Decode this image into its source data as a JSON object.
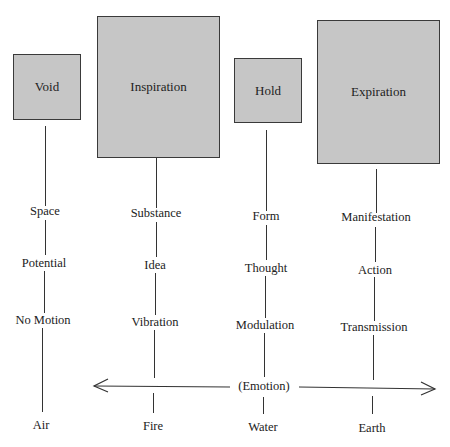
{
  "diagram": {
    "columns": [
      {
        "box": "Void",
        "items": [
          "Space",
          "Potential",
          "No Motion"
        ],
        "element": "Air"
      },
      {
        "box": "Inspiration",
        "items": [
          "Substance",
          "Idea",
          "Vibration"
        ],
        "element": "Fire"
      },
      {
        "box": "Hold",
        "items": [
          "Form",
          "Thought",
          "Modulation"
        ],
        "element": "Water"
      },
      {
        "box": "Expiration",
        "items": [
          "Manifestation",
          "Action",
          "Transmission"
        ],
        "element": "Earth"
      }
    ],
    "axis_label": "(Emotion)",
    "colors": {
      "box_fill": "#c6c6c6",
      "box_border": "#3a3a3a",
      "line": "#333333"
    }
  }
}
